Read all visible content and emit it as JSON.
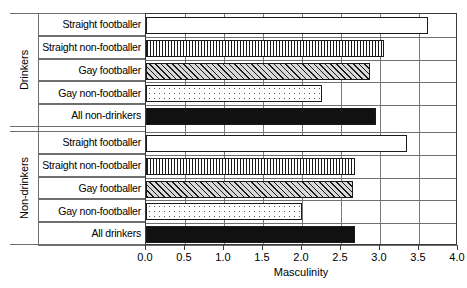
{
  "chart_data": {
    "type": "bar",
    "orientation": "horizontal",
    "title": "",
    "xlabel": "Masculinity",
    "ylabel": "",
    "xlim": [
      0.0,
      4.0
    ],
    "xticks": [
      "0.0",
      "0.5",
      "1.0",
      "1.5",
      "2.0",
      "2.5",
      "3.0",
      "3.5",
      "4.0"
    ],
    "xtick_values": [
      0.0,
      0.5,
      1.0,
      1.5,
      2.0,
      2.5,
      3.0,
      3.5,
      4.0
    ],
    "grid": "vertical",
    "legend": "none",
    "groups": [
      {
        "name": "Drinkers",
        "bars": [
          {
            "label": "Straight footballer",
            "value": 3.62,
            "pattern": "blank"
          },
          {
            "label": "Straight non-footballer",
            "value": 3.05,
            "pattern": "vertical-stripes"
          },
          {
            "label": "Gay footballer",
            "value": 2.87,
            "pattern": "diagonal-hatch"
          },
          {
            "label": "Gay non-footballer",
            "value": 2.25,
            "pattern": "dots"
          },
          {
            "label": "All non-drinkers",
            "value": 2.95,
            "pattern": "solid-black"
          }
        ]
      },
      {
        "name": "Non-drinkers",
        "bars": [
          {
            "label": "Straight footballer",
            "value": 3.35,
            "pattern": "blank"
          },
          {
            "label": "Straight non-footballer",
            "value": 2.68,
            "pattern": "vertical-stripes"
          },
          {
            "label": "Gay footballer",
            "value": 2.65,
            "pattern": "diagonal-hatch"
          },
          {
            "label": "Gay non-footballer",
            "value": 2.0,
            "pattern": "dots"
          },
          {
            "label": "All drinkers",
            "value": 2.68,
            "pattern": "solid-black"
          }
        ]
      }
    ]
  }
}
